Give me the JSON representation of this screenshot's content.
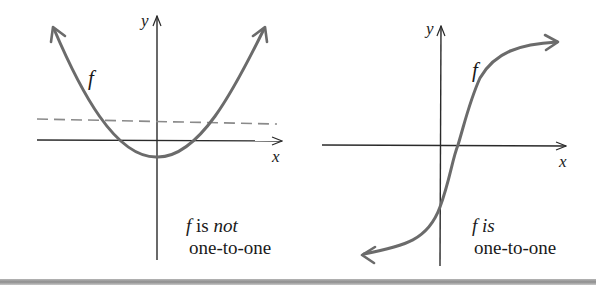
{
  "figure": {
    "colors": {
      "curve": "#6b6b6b",
      "axis": "#2a2a2a",
      "dashed_line": "#8a8a8a",
      "bottom_bar": "#9a9a9a"
    },
    "left_panel": {
      "axis_labels": {
        "x": "x",
        "y": "y"
      },
      "curve_label": "f",
      "caption": {
        "line1_f": "f",
        "line1_is": " is ",
        "line1_not": "not",
        "line2": "one-to-one"
      },
      "curve_type": "parabola",
      "has_horizontal_line_test": true
    },
    "right_panel": {
      "axis_labels": {
        "x": "x",
        "y": "y"
      },
      "curve_label": "f",
      "caption": {
        "line1_f": "f",
        "line1_is": " is",
        "line2": "one-to-one"
      },
      "curve_type": "increasing S-curve"
    }
  }
}
